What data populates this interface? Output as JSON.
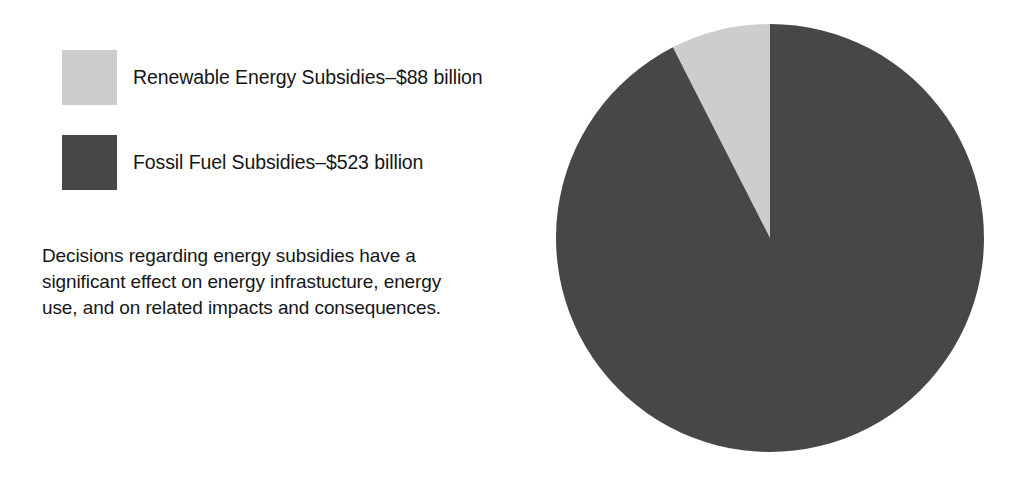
{
  "legend": {
    "items": [
      {
        "name": "renewable-energy-subsidies",
        "label": "Renewable Energy Subsidies–$88 billion",
        "swatch": "light",
        "color": "#cdcdcd"
      },
      {
        "name": "fossil-fuel-subsidies",
        "label": "Fossil Fuel Subsidies–$523 billion",
        "swatch": "dark",
        "color": "#474747"
      }
    ]
  },
  "caption": {
    "lines": [
      "Decisions regarding energy subsidies have a",
      "significant effect on energy infrastucture, energy",
      "use, and on related impacts and consequences."
    ]
  },
  "chart_data": {
    "type": "pie",
    "title": "",
    "unit": "billion USD",
    "categories": [
      "Renewable Energy Subsidies",
      "Fossil Fuel Subsidies"
    ],
    "values": [
      88,
      523
    ],
    "value_labels": [
      "$88 billion",
      "$523 billion"
    ],
    "total": 611,
    "percentages": [
      14.4,
      85.6
    ],
    "colors": [
      "#cdcdcd",
      "#474747"
    ],
    "legend_entries": [
      "Renewable Energy Subsidies–$88 billion",
      "Fossil Fuel Subsidies–$523 billion"
    ],
    "legend_position": "left",
    "grid": false,
    "start_angle_deg": 0,
    "direction": "counter-clockwise",
    "slice_sweep_deg": [
      27,
      333
    ],
    "geometry": {
      "center_x": 770,
      "center_y": 238,
      "radius": 214
    }
  }
}
